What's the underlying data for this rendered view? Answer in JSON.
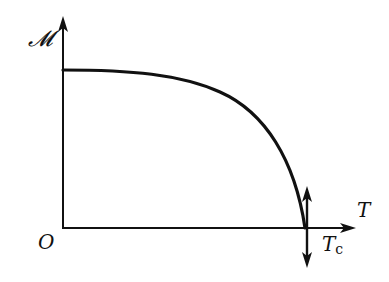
{
  "diagram": {
    "type": "magnetization-vs-temperature",
    "labels": {
      "y_axis": "𝓜",
      "x_axis": "T",
      "origin": "O",
      "critical_temp_main": "T",
      "critical_temp_sub": "c"
    },
    "colors": {
      "stroke": "#111111",
      "background": "#ffffff"
    },
    "curve": {
      "description": "Magnetization M(T) decreasing from saturation value at T=0 to zero at critical temperature Tc",
      "start": {
        "x": 63,
        "y": 70
      },
      "end": {
        "x": 305,
        "y": 228
      }
    },
    "vertical_double_arrow": {
      "x": 307,
      "top": 188,
      "bottom": 266
    }
  }
}
